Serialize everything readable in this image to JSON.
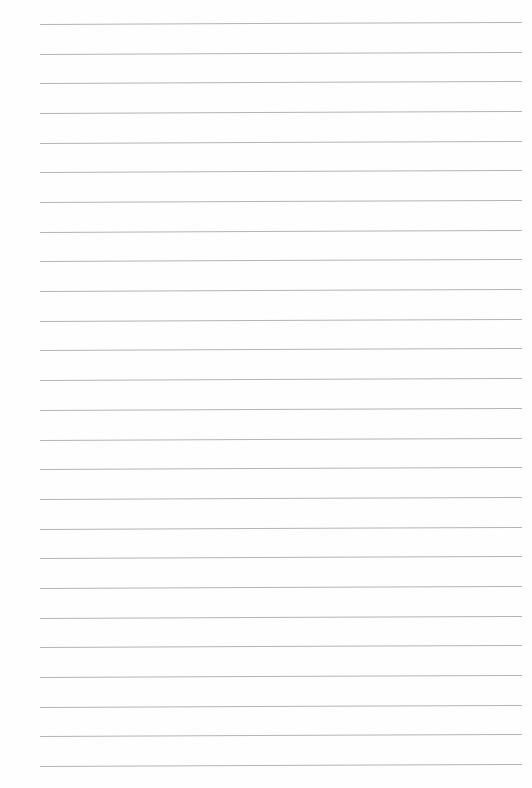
{
  "page": {
    "type": "lined-paper",
    "background_color": "#fefefe",
    "line_color": "#b4b4b4",
    "line_count": 26,
    "first_line_y": 24,
    "line_spacing": 29.68,
    "line_left_x": 40,
    "line_right_x": 522
  }
}
